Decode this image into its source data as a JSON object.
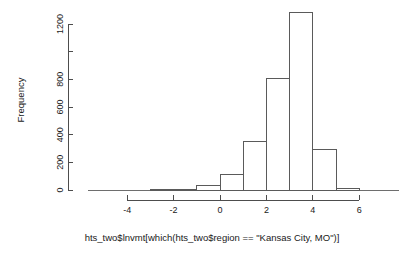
{
  "chart_data": {
    "type": "bar",
    "title": "",
    "subtitle": "",
    "xlabel": "hts_two$lnvmt[which(hts_two$region == \"Kansas City, MO\")]",
    "ylabel": "Frequency",
    "grid": false,
    "legend": false,
    "xlim": [
      -4.6,
      6.4
    ],
    "ylim": [
      0,
      1300
    ],
    "xticks": [
      -4,
      -2,
      0,
      2,
      4,
      6
    ],
    "xticklabels": [
      "-4",
      "-2",
      "0",
      "2",
      "4",
      "6"
    ],
    "yticks": [
      0,
      200,
      400,
      600,
      800,
      1000,
      1200
    ],
    "yticklabels": [
      "0",
      "200",
      "400",
      "600",
      "800",
      "",
      "1200"
    ],
    "bin_width": 1,
    "bin_edges": [
      -3,
      -2,
      -1,
      0,
      1,
      2,
      3,
      4,
      5,
      6
    ],
    "bin_centers": [
      -2.5,
      -1.5,
      -0.5,
      0.5,
      1.5,
      2.5,
      3.5,
      4.5,
      5.5
    ],
    "values": [
      2,
      3,
      30,
      112,
      348,
      806,
      1280,
      296,
      8
    ],
    "bars": [
      {
        "left": -3,
        "right": -2,
        "count": 2
      },
      {
        "left": -2,
        "right": -1,
        "count": 3
      },
      {
        "left": -1,
        "right": 0,
        "count": 30
      },
      {
        "left": 0,
        "right": 1,
        "count": 112
      },
      {
        "left": 1,
        "right": 2,
        "count": 348
      },
      {
        "left": 2,
        "right": 3,
        "count": 806
      },
      {
        "left": 3,
        "right": 4,
        "count": 1280
      },
      {
        "left": 4,
        "right": 5,
        "count": 296
      },
      {
        "left": 5,
        "right": 6,
        "count": 8
      }
    ]
  },
  "colors": {
    "background": "#ffffff",
    "bar_stroke": "#5a5a5a",
    "axis": "#4d4d4d",
    "text": "#1a1a1a"
  }
}
